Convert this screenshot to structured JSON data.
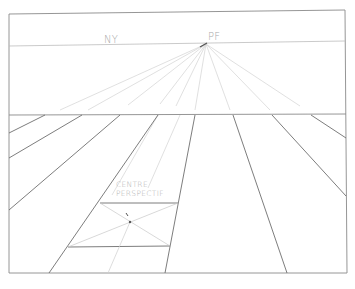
{
  "labels": {
    "horizon": "NY",
    "vanishing_point": "PF",
    "centre_line1": "CENTRE",
    "centre_line2": "PERSPECTIF"
  },
  "colors": {
    "frame": "#7a7a7a",
    "construction": "#cfcfcf",
    "ground": "#6e6e6e",
    "label": "#a8a8a8"
  },
  "geometry": {
    "frame": {
      "x1": 8,
      "y1": 12,
      "x2": 346,
      "y2": 273
    },
    "horizon_y": 44,
    "vanishing_point": {
      "x": 206,
      "y": 44
    },
    "picture_plane_y": 115,
    "centre_perspectif": {
      "x": 130,
      "y": 222
    }
  }
}
